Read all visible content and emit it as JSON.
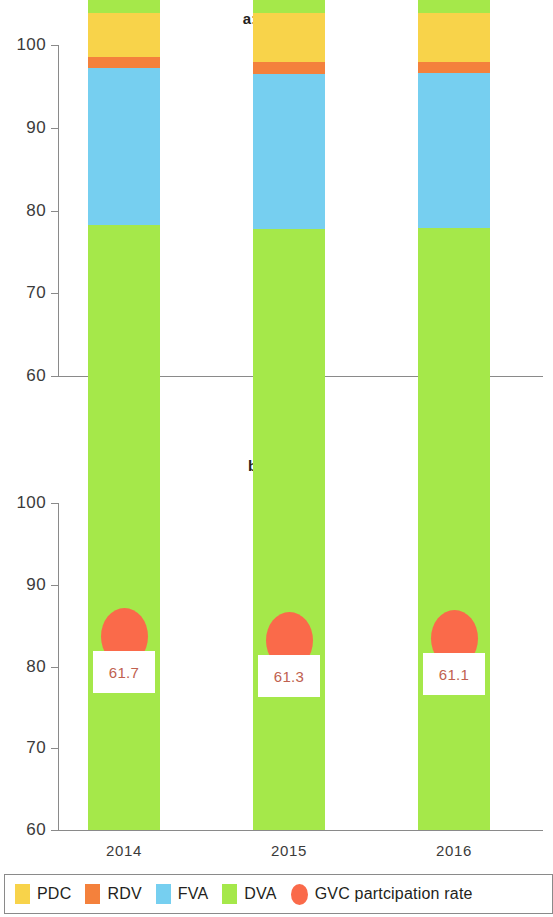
{
  "figure": {
    "panels": [
      {
        "title": "a: World",
        "categories": [
          "2014",
          "2015",
          "2016"
        ],
        "y_ticks": [
          "100",
          "90",
          "80",
          "70",
          "60"
        ]
      },
      {
        "title": "b: Asia",
        "categories": [
          "2014",
          "2015",
          "2016"
        ],
        "y_ticks": [
          "100",
          "90",
          "80",
          "70",
          "60"
        ]
      }
    ]
  },
  "legend": {
    "items": [
      {
        "label": "PDC",
        "color": "#F8D34A",
        "shape": "square"
      },
      {
        "label": "RDV",
        "color": "#F4813C",
        "shape": "square"
      },
      {
        "label": "FVA",
        "color": "#76CFF0",
        "shape": "square"
      },
      {
        "label": "DVA",
        "color": "#A5E84A",
        "shape": "square"
      },
      {
        "label": "GVC partcipation rate",
        "color": "#FA6A4A",
        "shape": "ellipse"
      }
    ]
  },
  "colors": {
    "pdc": "#F8D34A",
    "rdv": "#F4813C",
    "fva": "#76CFF0",
    "dva": "#A5E84A",
    "gvc_marker": "#FA6A4A",
    "value_text": "#C0614F",
    "axis": "#8a8a8a",
    "text": "#231f20"
  },
  "chart_data": [
    {
      "type": "bar",
      "title": "a: World",
      "stacked": true,
      "xlabel": "",
      "ylabel": "",
      "ylim": [
        60,
        100
      ],
      "yticks": [
        60,
        70,
        80,
        90,
        100
      ],
      "grid": false,
      "legend_position": "bottom",
      "categories": [
        "2014",
        "2015",
        "2016"
      ],
      "series": [
        {
          "name": "DVA",
          "color": "#A5E84A",
          "values": [
            72.0,
            70.4,
            71.1
          ]
        },
        {
          "name": "FVA",
          "color": "#76CFF0",
          "values": [
            17.6,
            19.1,
            18.4
          ]
        },
        {
          "name": "RDV",
          "color": "#F4813C",
          "values": [
            2.7,
            2.6,
            2.6
          ]
        },
        {
          "name": "PDC",
          "color": "#F8D34A",
          "values": [
            7.7,
            7.9,
            7.9
          ]
        }
      ],
      "annotations": [
        {
          "name": "GVC partcipation rate",
          "type": "marker",
          "color": "#FA6A4A",
          "values": [
            "66.5",
            "67.1",
            "67.0"
          ]
        }
      ]
    },
    {
      "type": "bar",
      "title": "b: Asia",
      "stacked": true,
      "xlabel": "",
      "ylabel": "",
      "ylim": [
        60,
        100
      ],
      "yticks": [
        60,
        70,
        80,
        90,
        100
      ],
      "grid": false,
      "legend_position": "bottom",
      "categories": [
        "2014",
        "2015",
        "2016"
      ],
      "series": [
        {
          "name": "DVA",
          "color": "#A5E84A",
          "values": [
            74.0,
            73.5,
            73.7
          ]
        },
        {
          "name": "FVA",
          "color": "#76CFF0",
          "values": [
            19.2,
            19.0,
            18.9
          ]
        },
        {
          "name": "RDV",
          "color": "#F4813C",
          "values": [
            1.3,
            1.4,
            1.3
          ]
        },
        {
          "name": "PDC",
          "color": "#F8D34A",
          "values": [
            5.5,
            6.1,
            6.1
          ]
        }
      ],
      "annotations": [
        {
          "name": "GVC partcipation rate",
          "type": "marker",
          "color": "#FA6A4A",
          "values": [
            "61.7",
            "61.3",
            "61.1"
          ]
        }
      ]
    }
  ]
}
